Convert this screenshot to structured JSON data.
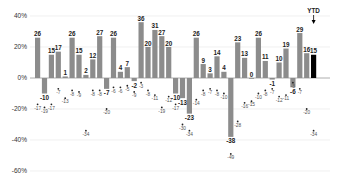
{
  "chart_data": {
    "type": "bar",
    "title": "",
    "xlabel": "",
    "ylabel": "",
    "ylim": [
      -60,
      40
    ],
    "yticks": [
      "40%",
      "20%",
      "0%",
      "-20%",
      "-40%",
      "-60%"
    ],
    "grid": true,
    "annotations": [
      {
        "text": "YTD",
        "target_index": 40
      }
    ],
    "colors": {
      "bar": "#8c8c8c",
      "ytd_bar": "#000000",
      "grid": "#e6e6e6",
      "baseline": "#999999"
    },
    "series": [
      {
        "name": "Annual return (%)",
        "values": [
          26,
          -10,
          15,
          17,
          1,
          26,
          15,
          2,
          12,
          27,
          -7,
          26,
          4,
          7,
          -2,
          36,
          20,
          31,
          27,
          20,
          -10,
          -13,
          -23,
          26,
          9,
          3,
          14,
          4,
          -38,
          23,
          13,
          0,
          26,
          11,
          -1,
          10,
          19,
          -6,
          29,
          16,
          15
        ]
      },
      {
        "name": "Intra-year decline (%)",
        "values": [
          -17,
          -19,
          -17,
          -7,
          -13,
          -8,
          -9,
          -34,
          -8,
          -8,
          -20,
          -6,
          -6,
          -5,
          -9,
          -3,
          -8,
          -11,
          -19,
          -12,
          -17,
          -30,
          -34,
          -14,
          -8,
          -7,
          -8,
          -10,
          -49,
          -28,
          -16,
          -15,
          -10,
          -8,
          -7,
          -12,
          -11,
          -3,
          -7,
          -20,
          -34,
          -5
        ]
      }
    ]
  }
}
